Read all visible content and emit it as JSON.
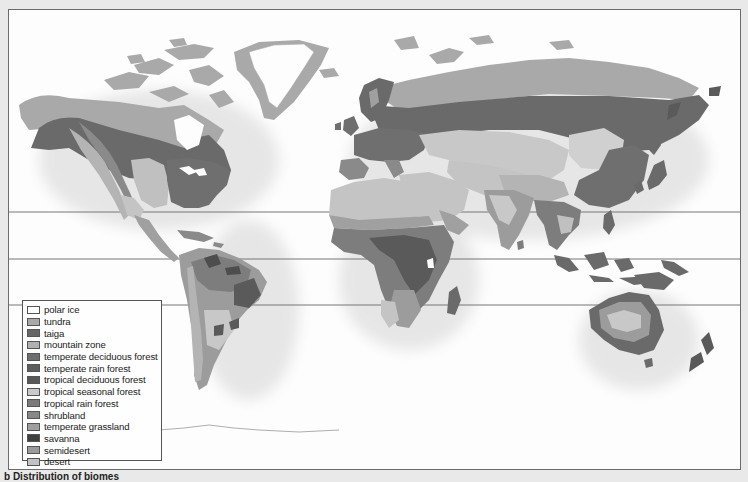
{
  "map": {
    "title": "World biomes",
    "latitude_lines_y": [
      202,
      249,
      295
    ],
    "colors": {
      "polar_ice": "#fdfdfd",
      "tundra": "#a9a9a9",
      "taiga": "#6a6a6a",
      "mountain_zone": "#b4b4b4",
      "temperate_deciduous_forest": "#6f6f6f",
      "temperate_rain_forest": "#606060",
      "tropical_deciduous_forest": "#5a5a5a",
      "tropical_seasonal_forest": "#c8c8c8",
      "tropical_rain_forest": "#7d7d7d",
      "shrubland": "#8a8a8a",
      "temperate_grassland": "#9c9c9c",
      "savanna": "#4d4d4d",
      "semidesert": "#a0a0a0",
      "desert": "#c4c4c4"
    }
  },
  "legend": {
    "items": [
      {
        "label": "polar ice",
        "color": "#ffffff"
      },
      {
        "label": "tundra",
        "color": "#a9a9a9"
      },
      {
        "label": "taiga",
        "color": "#666666"
      },
      {
        "label": "mountain zone",
        "color": "#b0b0b0"
      },
      {
        "label": "temperate deciduous forest",
        "color": "#6e6e6e"
      },
      {
        "label": "temperate rain forest",
        "color": "#5e5e5e"
      },
      {
        "label": "tropical deciduous forest",
        "color": "#585858"
      },
      {
        "label": "tropical seasonal forest",
        "color": "#cacaca"
      },
      {
        "label": "tropical rain forest",
        "color": "#7a7a7a"
      },
      {
        "label": "shrubland",
        "color": "#888888"
      },
      {
        "label": "temperate grassland",
        "color": "#9e9e9e"
      },
      {
        "label": "savanna",
        "color": "#3f3f3f"
      },
      {
        "label": "semidesert",
        "color": "#9a9a9a"
      },
      {
        "label": "desert",
        "color": "#c2c2c2"
      }
    ]
  },
  "caption": "b  Distribution of biomes"
}
